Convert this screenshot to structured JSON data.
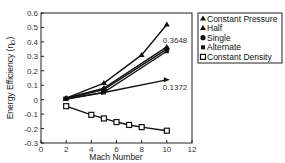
{
  "chart_data": {
    "type": "line",
    "title": "",
    "xlabel": "Mach Number",
    "ylabel": "Energy Efficiency (η",
    "ylabel_sub": "D",
    "ylabel_end": ")",
    "xlim": [
      0,
      12
    ],
    "ylim": [
      -0.3,
      0.6
    ],
    "xticks": [
      0,
      2,
      4,
      6,
      8,
      10,
      12
    ],
    "yticks": [
      0.6,
      0.5,
      0.4,
      0.3,
      0.2,
      0.1,
      0,
      -0.1,
      -0.2,
      -0.3
    ],
    "legend_position": "top-right (outside)",
    "series": [
      {
        "name": "Constant Pressure",
        "marker": "triangle",
        "x": [
          2,
          5,
          8,
          10
        ],
        "y": [
          0.01,
          0.115,
          0.31,
          0.52
        ]
      },
      {
        "name": "Half",
        "marker": "triangle",
        "x": [
          2,
          5,
          10
        ],
        "y": [
          0.01,
          0.08,
          0.365
        ]
      },
      {
        "name": "Single",
        "marker": "circle",
        "x": [
          2,
          5,
          10
        ],
        "y": [
          0.008,
          0.07,
          0.35
        ]
      },
      {
        "name": "Alternate",
        "marker": "square-filled",
        "x": [
          2,
          5,
          10
        ],
        "y": [
          0.005,
          0.05,
          0.335
        ]
      },
      {
        "name": "",
        "marker": "arrow",
        "x": [
          2,
          5,
          10
        ],
        "y": [
          0.005,
          0.05,
          0.1372
        ]
      },
      {
        "name": "Constant Density",
        "marker": "square-open",
        "x": [
          2,
          4,
          5,
          6,
          7,
          8,
          10
        ],
        "y": [
          -0.045,
          -0.105,
          -0.13,
          -0.155,
          -0.175,
          -0.19,
          -0.215
        ]
      }
    ],
    "annotations": [
      {
        "text": "0.3648",
        "x": 10,
        "y": 0.41
      },
      {
        "text": "0.1372",
        "x": 10,
        "y": 0.085
      }
    ]
  }
}
